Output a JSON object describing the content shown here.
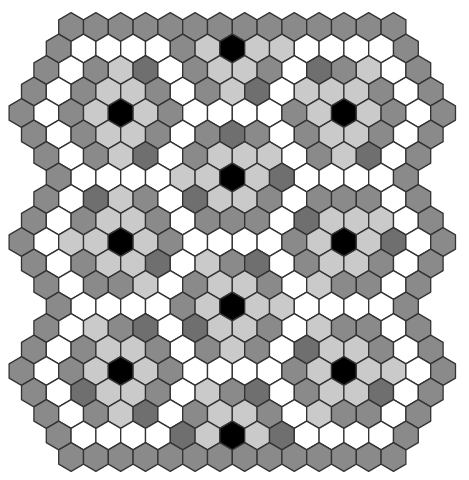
{
  "board": {
    "hex_width": 24.8,
    "row_step": 21.5,
    "origin_x": 21.5,
    "origin_y": 27,
    "palette": {
      "M": "#8a8a8a",
      "D": "#6f6f6f",
      "L": "#cacaca",
      "W": "#ffffff",
      "K": "#000000"
    },
    "stroke": "#333333",
    "rows": [
      {
        "offset": 2,
        "cells": "MMMMMMMMMMMMMM"
      },
      {
        "offset": 1.5,
        "cells": "MWWWWMLKLLWWWWM"
      },
      {
        "offset": 1,
        "cells": "MWMLDWMLLMWDMLWM"
      },
      {
        "offset": 0.5,
        "cells": "MWMLLMWMLDWLLLMWM"
      },
      {
        "offset": 0,
        "cells": "MWMLKLMWWWWMLKLMWM"
      },
      {
        "offset": 0.5,
        "cells": "MWMLLMWMDMWMLLMWM"
      },
      {
        "offset": 1,
        "cells": "MWMLDWMLLLWMLDWM"
      },
      {
        "offset": 1.5,
        "cells": "MWWWWLLKLDWWWWM"
      },
      {
        "offset": 1,
        "cells": "MWDLMWDLLMWMMMWM"
      },
      {
        "offset": 0.5,
        "cells": "MWMLLMWMMMWDLLLWM"
      },
      {
        "offset": 0,
        "cells": "MWLLKLMWWWWMLKLDWM"
      },
      {
        "offset": 0.5,
        "cells": "MWMLLDWLMDWMLLMWM"
      },
      {
        "offset": 1,
        "cells": "MWMMLWMLLMWLMMWM"
      },
      {
        "offset": 1.5,
        "cells": "MWWWWMLKLLWWWWM"
      },
      {
        "offset": 1,
        "cells": "MWLMDWDLLMWLMMWM"
      },
      {
        "offset": 0.5,
        "cells": "MWMLLMWMLMWDLLMWM"
      },
      {
        "offset": 0,
        "cells": "MWMLKLMWWWWMLKLLWM"
      },
      {
        "offset": 0.5,
        "cells": "MWDLLMWLMDWMLLDWM"
      },
      {
        "offset": 1,
        "cells": "MWMLDWMLLMWLMMWM"
      },
      {
        "offset": 1.5,
        "cells": "MWWWWDLKLDWWWWM"
      },
      {
        "offset": 2,
        "cells": "MMMMMMMMMMMMMM"
      }
    ]
  }
}
